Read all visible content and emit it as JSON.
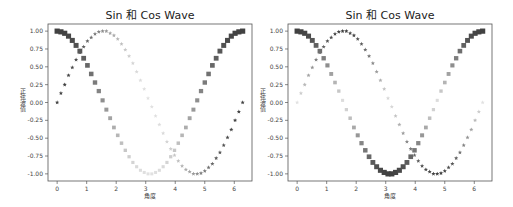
{
  "figure": {
    "panels": [
      {
        "title": "Sin 和 Cos Wave",
        "xlabel": "角度",
        "ylabel": "正弦波值"
      },
      {
        "title": "Sin 和 Cos Wave",
        "xlabel": "角度",
        "ylabel": "正弦波值"
      }
    ]
  },
  "chart_data": [
    {
      "type": "scatter",
      "title": "Sin 和 Cos Wave",
      "xlabel": "角度",
      "ylabel": "正弦波值",
      "xlim": [
        -0.31,
        6.6
      ],
      "ylim": [
        -1.1,
        1.1
      ],
      "xticks": [
        0,
        1,
        2,
        3,
        4,
        5,
        6
      ],
      "yticks": [
        "1.00",
        "0.75",
        "0.50",
        "0.25",
        "0.00",
        "-0.25",
        "-0.50",
        "-0.75",
        "-1.00"
      ],
      "grid": false,
      "legend": null,
      "color_mode": "gray_by_cos_value",
      "x": [
        0.0,
        0.128,
        0.256,
        0.385,
        0.513,
        0.641,
        0.769,
        0.898,
        1.026,
        1.154,
        1.282,
        1.411,
        1.539,
        1.667,
        1.795,
        1.923,
        2.052,
        2.18,
        2.308,
        2.436,
        2.565,
        2.693,
        2.821,
        2.949,
        3.078,
        3.206,
        3.334,
        3.462,
        3.59,
        3.719,
        3.847,
        3.975,
        4.103,
        4.232,
        4.36,
        4.488,
        4.616,
        4.745,
        4.873,
        5.001,
        5.129,
        5.258,
        5.386,
        5.514,
        5.642,
        5.771,
        5.899,
        6.027,
        6.155,
        6.283
      ],
      "series": [
        {
          "name": "sin",
          "marker": "star",
          "values": [
            0.0,
            0.13,
            0.25,
            0.38,
            0.49,
            0.6,
            0.7,
            0.78,
            0.86,
            0.91,
            0.96,
            0.99,
            1.0,
            1.0,
            0.97,
            0.94,
            0.89,
            0.82,
            0.74,
            0.65,
            0.55,
            0.43,
            0.31,
            0.19,
            0.06,
            -0.06,
            -0.19,
            -0.31,
            -0.43,
            -0.55,
            -0.65,
            -0.74,
            -0.82,
            -0.89,
            -0.94,
            -0.97,
            -1.0,
            -1.0,
            -0.99,
            -0.96,
            -0.91,
            -0.86,
            -0.78,
            -0.7,
            -0.6,
            -0.49,
            -0.38,
            -0.25,
            -0.13,
            0.0
          ]
        },
        {
          "name": "cos",
          "marker": "square",
          "values": [
            1.0,
            0.99,
            0.97,
            0.93,
            0.87,
            0.8,
            0.72,
            0.62,
            0.52,
            0.4,
            0.28,
            0.16,
            0.03,
            -0.1,
            -0.22,
            -0.35,
            -0.46,
            -0.57,
            -0.67,
            -0.76,
            -0.84,
            -0.9,
            -0.95,
            -0.98,
            -1.0,
            -1.0,
            -0.98,
            -0.95,
            -0.9,
            -0.84,
            -0.76,
            -0.67,
            -0.57,
            -0.46,
            -0.35,
            -0.22,
            -0.1,
            0.03,
            0.16,
            0.28,
            0.4,
            0.52,
            0.62,
            0.72,
            0.8,
            0.87,
            0.93,
            0.97,
            0.99,
            1.0
          ]
        }
      ]
    },
    {
      "type": "scatter",
      "title": "Sin 和 Cos Wave",
      "xlabel": "角度",
      "ylabel": "正弦波值",
      "xlim": [
        -0.31,
        6.6
      ],
      "ylim": [
        -1.1,
        1.1
      ],
      "xticks": [
        0,
        1,
        2,
        3,
        4,
        5,
        6
      ],
      "yticks": [
        "1.00",
        "0.75",
        "0.50",
        "0.25",
        "0.00",
        "-0.25",
        "-0.50",
        "-0.75",
        "-1.00"
      ],
      "grid": false,
      "legend": null,
      "color_mode": "gray_by_abs_own_value",
      "x": [
        0.0,
        0.128,
        0.256,
        0.385,
        0.513,
        0.641,
        0.769,
        0.898,
        1.026,
        1.154,
        1.282,
        1.411,
        1.539,
        1.667,
        1.795,
        1.923,
        2.052,
        2.18,
        2.308,
        2.436,
        2.565,
        2.693,
        2.821,
        2.949,
        3.078,
        3.206,
        3.334,
        3.462,
        3.59,
        3.719,
        3.847,
        3.975,
        4.103,
        4.232,
        4.36,
        4.488,
        4.616,
        4.745,
        4.873,
        5.001,
        5.129,
        5.258,
        5.386,
        5.514,
        5.642,
        5.771,
        5.899,
        6.027,
        6.155,
        6.283
      ],
      "series": [
        {
          "name": "sin",
          "marker": "star",
          "values": [
            0.0,
            0.13,
            0.25,
            0.38,
            0.49,
            0.6,
            0.7,
            0.78,
            0.86,
            0.91,
            0.96,
            0.99,
            1.0,
            1.0,
            0.97,
            0.94,
            0.89,
            0.82,
            0.74,
            0.65,
            0.55,
            0.43,
            0.31,
            0.19,
            0.06,
            -0.06,
            -0.19,
            -0.31,
            -0.43,
            -0.55,
            -0.65,
            -0.74,
            -0.82,
            -0.89,
            -0.94,
            -0.97,
            -1.0,
            -1.0,
            -0.99,
            -0.96,
            -0.91,
            -0.86,
            -0.78,
            -0.7,
            -0.6,
            -0.49,
            -0.38,
            -0.25,
            -0.13,
            0.0
          ]
        },
        {
          "name": "cos",
          "marker": "square",
          "values": [
            1.0,
            0.99,
            0.97,
            0.93,
            0.87,
            0.8,
            0.72,
            0.62,
            0.52,
            0.4,
            0.28,
            0.16,
            0.03,
            -0.1,
            -0.22,
            -0.35,
            -0.46,
            -0.57,
            -0.67,
            -0.76,
            -0.84,
            -0.9,
            -0.95,
            -0.98,
            -1.0,
            -1.0,
            -0.98,
            -0.95,
            -0.9,
            -0.84,
            -0.76,
            -0.67,
            -0.57,
            -0.46,
            -0.35,
            -0.22,
            -0.1,
            0.03,
            0.16,
            0.28,
            0.4,
            0.52,
            0.62,
            0.72,
            0.8,
            0.87,
            0.93,
            0.97,
            0.99,
            1.0
          ]
        }
      ]
    }
  ]
}
